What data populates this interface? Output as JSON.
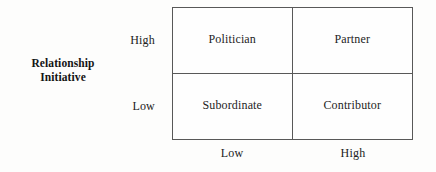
{
  "figure": {
    "type": "2x2-matrix",
    "y_axis": {
      "title_line1": "Relationship",
      "title_line2": "Initiative",
      "ticks": [
        "High",
        "Low"
      ]
    },
    "x_axis": {
      "title": "",
      "ticks": [
        "Low",
        "High"
      ]
    },
    "cells": [
      {
        "label": "Politician",
        "row": "High",
        "col": "Low"
      },
      {
        "label": "Partner",
        "row": "High",
        "col": "High"
      },
      {
        "label": "Subordinate",
        "row": "Low",
        "col": "Low"
      },
      {
        "label": "Contributor",
        "row": "Low",
        "col": "High"
      }
    ],
    "colors": {
      "border": "#585858",
      "text": "#1a1a1a",
      "background": "#fdfdfc"
    }
  }
}
